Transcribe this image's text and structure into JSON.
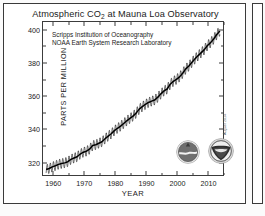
{
  "chart_data": {
    "type": "line",
    "title": "Atmospheric CO2 at Mauna Loa Observatory",
    "title_main": "Atmospheric CO",
    "title_sub": "2",
    "title_tail": " at Mauna Loa Observatory",
    "xlabel": "YEAR",
    "ylabel": "PARTS PER MILLION",
    "xlim": [
      1957,
      2015
    ],
    "ylim": [
      312,
      404
    ],
    "xticks": [
      1960,
      1970,
      1980,
      1990,
      2000,
      2010
    ],
    "xticks_minor": [
      1965,
      1975,
      1985,
      1995,
      2005,
      2015
    ],
    "yticks": [
      320,
      340,
      360,
      380,
      400
    ],
    "yticks_minor": [
      330,
      350,
      370,
      390
    ],
    "grid": false,
    "legend": "none",
    "series_name": "Monthly mean CO2 concentration",
    "line_color": "#000000",
    "annotations": [
      "Scripps Institution of Oceanography",
      "NOAA Earth System Research Laboratory"
    ],
    "datestamp": "August 2014",
    "seasonal_amplitude_ppm": 3.0,
    "x": [
      1958,
      1959,
      1960,
      1961,
      1962,
      1963,
      1964,
      1965,
      1966,
      1967,
      1968,
      1969,
      1970,
      1971,
      1972,
      1973,
      1974,
      1975,
      1976,
      1977,
      1978,
      1979,
      1980,
      1981,
      1982,
      1983,
      1984,
      1985,
      1986,
      1987,
      1988,
      1989,
      1990,
      1991,
      1992,
      1993,
      1994,
      1995,
      1996,
      1997,
      1998,
      1999,
      2000,
      2001,
      2002,
      2003,
      2004,
      2005,
      2006,
      2007,
      2008,
      2009,
      2010,
      2011,
      2012,
      2013,
      2014
    ],
    "values": [
      315.3,
      315.9,
      316.9,
      317.6,
      318.4,
      318.9,
      319.3,
      320.0,
      321.4,
      322.2,
      323.0,
      324.6,
      325.7,
      326.3,
      327.5,
      329.7,
      330.2,
      331.1,
      332.0,
      333.8,
      335.4,
      336.8,
      338.7,
      340.1,
      341.4,
      343.0,
      344.6,
      346.0,
      347.4,
      349.2,
      351.6,
      353.1,
      354.4,
      355.6,
      356.4,
      357.1,
      358.8,
      360.8,
      362.6,
      363.7,
      366.6,
      368.3,
      369.5,
      371.0,
      373.2,
      375.8,
      377.5,
      379.8,
      381.9,
      383.8,
      385.6,
      387.4,
      389.9,
      391.6,
      393.8,
      396.5,
      398.6
    ]
  },
  "credit_line_1": "Scripps Institution of Oceanography",
  "credit_line_2": "NOAA Earth System Research Laboratory",
  "logos": {
    "scripps_name": "scripps-logo",
    "noaa_name": "noaa-logo"
  }
}
